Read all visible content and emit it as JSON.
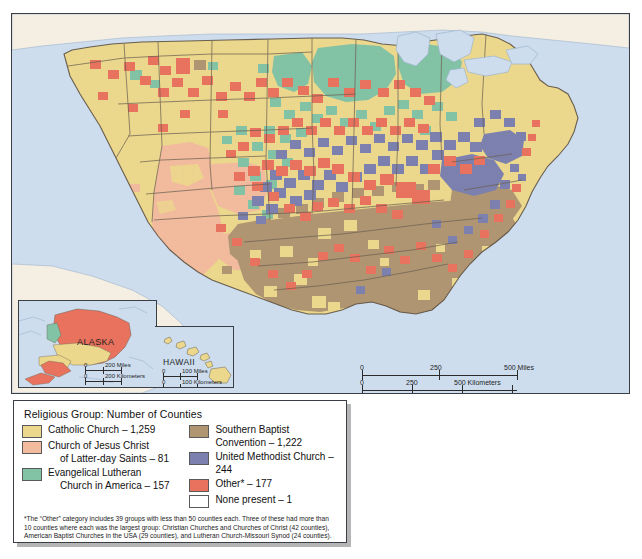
{
  "map": {
    "title_absent": true,
    "insets": {
      "alaska": {
        "label": "ALASKA"
      },
      "hawaii": {
        "label": "HAWAII"
      }
    },
    "scalebars": {
      "main": {
        "miles": {
          "ticks": [
            "0",
            "250",
            "500 Miles"
          ]
        },
        "kilometers": {
          "ticks": [
            "0",
            "250",
            "500 Kilometers"
          ]
        }
      },
      "alaska": {
        "miles": {
          "ticks": [
            "0",
            "200 Miles"
          ]
        },
        "kilometers": {
          "ticks": [
            "0",
            "200 Kilometers"
          ]
        }
      },
      "hawaii": {
        "miles": {
          "ticks": [
            "0",
            "100 Miles"
          ]
        },
        "kilometers": {
          "ticks": [
            "0",
            "100 Kilometers"
          ]
        }
      }
    },
    "colors": {
      "ocean": "#cdddee",
      "foreign_land": "#f4efe2",
      "frame": "#3a3f45",
      "county_border": "#b9a98c",
      "state_border": "#6b6052"
    }
  },
  "legend": {
    "title": "Religious Group:  Number of Counties",
    "items_left": [
      {
        "name": "catholic-church",
        "color": "#ecd88c",
        "line1": "Catholic Church – 1,259",
        "line2": "",
        "group": "Catholic Church",
        "counties": 1259
      },
      {
        "name": "church-of-jesus-christ-lds",
        "color": "#f2bb9e",
        "line1": "Church of Jesus Christ",
        "line2": "of Latter-day Saints – 81",
        "group": "Church of Jesus Christ of Latter-day Saints",
        "counties": 81
      },
      {
        "name": "evangelical-lutheran-church-in-america",
        "color": "#82c2a5",
        "line1": "Evangelical Lutheran",
        "line2": "Church in America – 157",
        "group": "Evangelical Lutheran Church in America",
        "counties": 157
      }
    ],
    "items_right": [
      {
        "name": "southern-baptist-convention",
        "color": "#b09572",
        "line1": "Southern Baptist",
        "line2": "Convention – 1,222",
        "group": "Southern Baptist Convention",
        "counties": 1222
      },
      {
        "name": "united-methodist-church",
        "color": "#7b80ae",
        "line1": "United Methodist Church – 244",
        "line2": "",
        "group": "United Methodist Church",
        "counties": 244
      },
      {
        "name": "other",
        "color": "#e8725e",
        "line1": "Other* – 177",
        "line2": "",
        "group": "Other*",
        "counties": 177
      },
      {
        "name": "none-present",
        "color": "#ffffff",
        "line1": "None present – 1",
        "line2": "",
        "group": "None present",
        "counties": 1
      }
    ],
    "footnote": "*The “Other” category includes 39 groups with less than 50 counties each. Three of these had more than 10 counties where each was the largest group: Christian Churches and Churches of Christ (42 counties),  American Baptist Churches in the USA (29 counties), and Lutheran Church-Missouri Synod (24 counties)."
  }
}
